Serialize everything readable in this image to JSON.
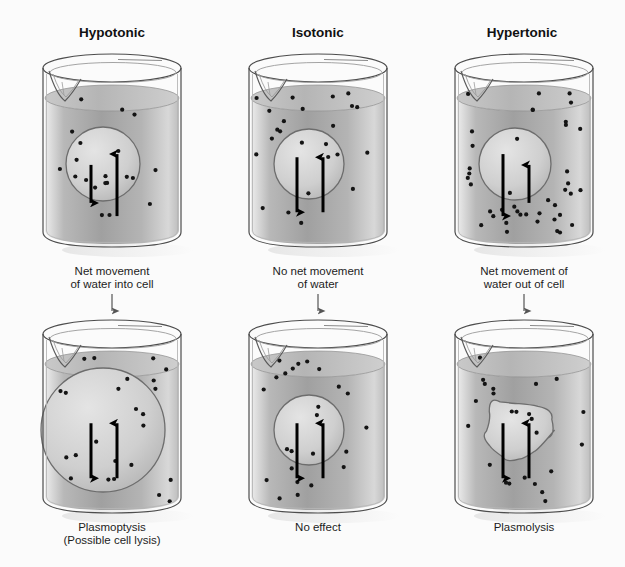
{
  "figure": {
    "background_color": "#fbfbfb",
    "line_color": "#3a3a3a",
    "solution_fill_light": "#f2f2f2",
    "solution_fill_mid": "#9e9e9e",
    "solute_dot_color": "#1a1a1a",
    "arrow_color": "#000000"
  },
  "columns": [
    {
      "id": "hypotonic",
      "title": "Hypotonic"
    },
    {
      "id": "isotonic",
      "title": "Isotonic"
    },
    {
      "id": "hypertonic",
      "title": "Hypertonic"
    }
  ],
  "middle_captions": [
    {
      "id": "hypotonic-caption",
      "text": "Net movement\nof water into cell"
    },
    {
      "id": "isotonic-caption",
      "text": "No net movement\nof water"
    },
    {
      "id": "hypertonic-caption",
      "text": "Net movement of\nwater out of cell"
    }
  ],
  "bottom_captions": [
    {
      "id": "plasmoptysis-caption",
      "text": "Plasmoptysis\n(Possible cell lysis)"
    },
    {
      "id": "no-effect-caption",
      "text": "No effect"
    },
    {
      "id": "plasmolysis-caption",
      "text": "Plasmolysis"
    }
  ],
  "chart_data": {
    "type": "diagram",
    "panels": [
      {
        "row": "top",
        "column": "hypotonic",
        "solution_solute_density": "low",
        "cell_solute_density": "high",
        "cell_shape": "round",
        "cell_radius_px": 37,
        "water_in_arrow": {
          "direction": "up",
          "length_px": 62,
          "meaning": "water into cell"
        },
        "water_out_arrow": {
          "direction": "down",
          "length_px": 38,
          "meaning": "water out of cell"
        },
        "net_flow": "into cell"
      },
      {
        "row": "top",
        "column": "isotonic",
        "solution_solute_density": "medium",
        "cell_solute_density": "medium",
        "cell_shape": "round",
        "cell_radius_px": 35,
        "water_in_arrow": {
          "direction": "up",
          "length_px": 55,
          "meaning": "water into cell"
        },
        "water_out_arrow": {
          "direction": "down",
          "length_px": 55,
          "meaning": "water out of cell"
        },
        "net_flow": "none"
      },
      {
        "row": "top",
        "column": "hypertonic",
        "solution_solute_density": "high",
        "cell_solute_density": "low",
        "cell_shape": "round",
        "cell_radius_px": 36,
        "water_in_arrow": {
          "direction": "up",
          "length_px": 38,
          "meaning": "water into cell"
        },
        "water_out_arrow": {
          "direction": "down",
          "length_px": 62,
          "meaning": "water out of cell"
        },
        "net_flow": "out of cell"
      },
      {
        "row": "bottom",
        "column": "hypotonic",
        "result": "Plasmoptysis (Possible cell lysis)",
        "solution_solute_density": "low",
        "cell_solute_density": "medium",
        "cell_shape": "round-swollen",
        "cell_radius_px": 62,
        "water_in_arrow": {
          "direction": "up",
          "length_px": 55,
          "meaning": "water into cell"
        },
        "water_out_arrow": {
          "direction": "down",
          "length_px": 55,
          "meaning": "water out of cell"
        },
        "net_flow": "none"
      },
      {
        "row": "bottom",
        "column": "isotonic",
        "result": "No effect",
        "solution_solute_density": "medium",
        "cell_solute_density": "medium",
        "cell_shape": "round",
        "cell_radius_px": 35,
        "water_in_arrow": {
          "direction": "up",
          "length_px": 55,
          "meaning": "water into cell"
        },
        "water_out_arrow": {
          "direction": "down",
          "length_px": 55,
          "meaning": "water out of cell"
        },
        "net_flow": "none"
      },
      {
        "row": "bottom",
        "column": "hypertonic",
        "result": "Plasmolysis",
        "solution_solute_density": "medium",
        "cell_solute_density": "medium",
        "cell_shape": "shriveled-irregular",
        "cell_radius_px": 34,
        "water_in_arrow": {
          "direction": "up",
          "length_px": 55,
          "meaning": "water into cell"
        },
        "water_out_arrow": {
          "direction": "down",
          "length_px": 55,
          "meaning": "water out of cell"
        },
        "net_flow": "none"
      }
    ]
  }
}
